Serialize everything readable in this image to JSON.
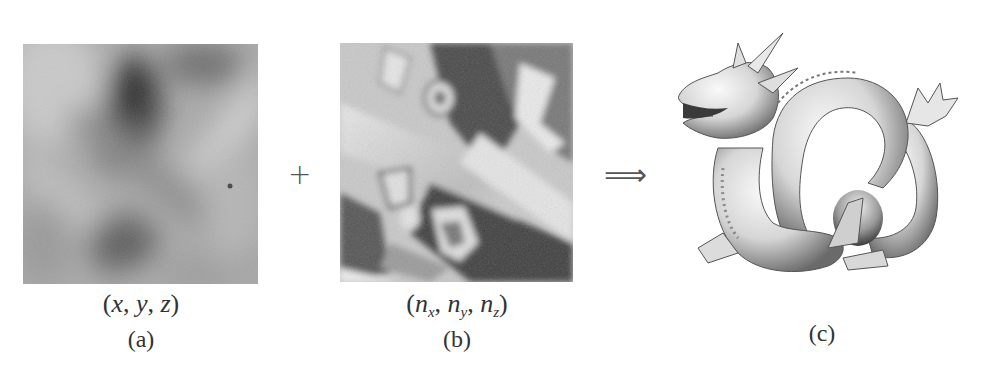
{
  "figure": {
    "panels": [
      {
        "id": "a",
        "label": "(a)",
        "content": "position-texture",
        "caption_math": {
          "open": "(",
          "close": ")",
          "vars": [
            "x",
            "y",
            "z"
          ],
          "subs": [
            "",
            "",
            ""
          ],
          "sep": ", "
        }
      },
      {
        "id": "b",
        "label": "(b)",
        "content": "normal-texture",
        "caption_math": {
          "open": "(",
          "close": ")",
          "vars": [
            "n",
            "n",
            "n"
          ],
          "subs": [
            "x",
            "y",
            "z"
          ],
          "sep": ", "
        }
      },
      {
        "id": "c",
        "label": "(c)",
        "content": "rendered-3d-dragon-model"
      }
    ],
    "operators": {
      "plus": "+",
      "implies": "⟹"
    }
  }
}
